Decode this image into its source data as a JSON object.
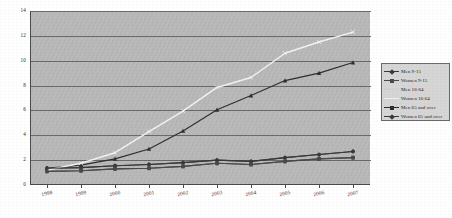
{
  "chart_data": {
    "type": "line",
    "title": "",
    "subtitle": "",
    "xlabel": "",
    "ylabel": "",
    "x": [
      "1998",
      "1999",
      "2000",
      "2001",
      "2002",
      "2003",
      "2004",
      "2005",
      "2006",
      "2007"
    ],
    "categories": [
      "1998",
      "1999",
      "2000",
      "2001",
      "2002",
      "2003",
      "2004",
      "2005",
      "2006",
      "2007"
    ],
    "ylim": [
      0,
      14
    ],
    "yticks": [
      "0",
      "2",
      "4",
      "6",
      "8",
      "10",
      "12",
      "14"
    ],
    "ytick_values": [
      0,
      2,
      4,
      6,
      8,
      10,
      12,
      14
    ],
    "grid": "horizontal",
    "legend_position": "right",
    "plot_background": "#b9b9b9",
    "series": [
      {
        "name": "Men 9-15",
        "color": "#3a3a3a",
        "marker": "diamond",
        "values": [
          1.35,
          1.4,
          1.55,
          1.65,
          1.8,
          2.0,
          1.9,
          2.2,
          2.45,
          2.7
        ]
      },
      {
        "name": "Women 9-15",
        "color": "#4a4a4a",
        "marker": "square",
        "values": [
          1.1,
          1.15,
          1.3,
          1.35,
          1.5,
          1.75,
          1.65,
          1.9,
          2.1,
          2.2
        ]
      },
      {
        "name": "Men 16-64",
        "color": "#2e2e2e",
        "marker": "triangle",
        "values": [
          1.35,
          1.6,
          2.1,
          2.9,
          4.35,
          6.05,
          7.2,
          8.4,
          9.0,
          9.85
        ]
      },
      {
        "name": "Women 16-64",
        "color": "#f2f2f2",
        "marker": "cross",
        "values": [
          1.2,
          1.75,
          2.6,
          4.3,
          5.95,
          7.85,
          8.65,
          10.6,
          11.5,
          12.3
        ]
      },
      {
        "name": "Men 65 and over",
        "color": "#3a3a3a",
        "marker": "circle",
        "values": [
          1.35,
          1.4,
          1.55,
          1.65,
          1.8,
          2.0,
          1.9,
          2.2,
          2.45,
          2.7
        ]
      },
      {
        "name": "Women 65 and over",
        "color": "#4a4a4a",
        "marker": "diamond",
        "values": [
          1.1,
          1.15,
          1.3,
          1.35,
          1.5,
          1.75,
          1.65,
          1.9,
          2.1,
          2.2
        ]
      }
    ]
  },
  "legend": {
    "items": [
      {
        "label": "Men 9-15",
        "color": "#3a3a3a",
        "marker": "diamond"
      },
      {
        "label": "Women 9-15",
        "color": "#4a4a4a",
        "marker": "square"
      },
      {
        "label": "Men 16-64",
        "color": "#cfcfcf",
        "marker": "none"
      },
      {
        "label": "Women 16-64",
        "color": "#efefef",
        "marker": "cross"
      },
      {
        "label": "Men 65 and over",
        "color": "#2e2e2e",
        "marker": "triangle"
      },
      {
        "label": "Women 65 and over",
        "color": "#3a3a3a",
        "marker": "diamond"
      }
    ]
  }
}
